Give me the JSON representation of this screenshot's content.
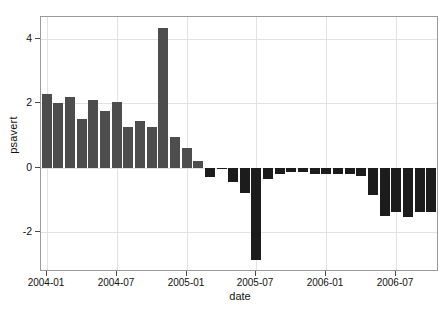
{
  "chart_data": {
    "type": "bar",
    "title": "",
    "xlabel": "date",
    "ylabel": "psavert",
    "x": [
      "2004-01",
      "2004-02",
      "2004-03",
      "2004-04",
      "2004-05",
      "2004-06",
      "2004-07",
      "2004-08",
      "2004-09",
      "2004-10",
      "2004-11",
      "2004-12",
      "2005-01",
      "2005-02",
      "2005-03",
      "2005-04",
      "2005-05",
      "2005-06",
      "2005-07",
      "2005-08",
      "2005-09",
      "2005-10",
      "2005-11",
      "2005-12",
      "2006-01",
      "2006-02",
      "2006-03",
      "2006-04",
      "2006-05",
      "2006-06",
      "2006-07",
      "2006-08",
      "2006-09",
      "2006-10"
    ],
    "values": [
      2.3,
      2.0,
      2.2,
      1.5,
      2.1,
      1.75,
      2.05,
      1.25,
      1.45,
      1.25,
      4.35,
      0.95,
      0.6,
      0.2,
      -0.3,
      -0.05,
      -0.45,
      -0.8,
      -2.9,
      -0.35,
      -0.2,
      -0.15,
      -0.15,
      -0.2,
      -0.2,
      -0.2,
      -0.2,
      -0.25,
      -0.85,
      -1.5,
      -1.4,
      -1.55,
      -1.4,
      -1.4
    ],
    "ylim": [
      -3.2,
      4.7
    ],
    "yticks": [
      4,
      2,
      0,
      -2
    ],
    "ytick_labels": [
      "4",
      "2",
      "0",
      "-2"
    ],
    "xticks": [
      "2004-01",
      "2004-07",
      "2005-01",
      "2005-07",
      "2006-01",
      "2006-07"
    ],
    "xtick_positions": [
      0,
      6,
      12,
      18,
      24,
      30
    ],
    "grid": true,
    "legend": "none",
    "bar_color_positive": "#4d4d4d",
    "bar_color_negative": "#1c1c1c",
    "grid_color": "#e2e2e2",
    "panel_border_color": "#9a9a9a",
    "background": "#ffffff"
  }
}
